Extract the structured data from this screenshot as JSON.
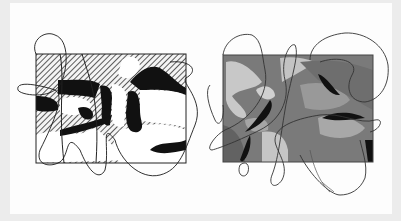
{
  "image": {
    "description": "Two abstract line drawings on white paper: a hatched black-and-white composition and a grayscale shaded composition, each overlaid with a continuous looping line",
    "background_color": "#ececec",
    "paper_color": "#fdfdfd"
  },
  "artworks": [
    {
      "name": "left-drawing",
      "style": "black ink with diagonal hatching",
      "colors": {
        "ink": "#111111",
        "paper": "#ffffff",
        "hatch": "#555555"
      }
    },
    {
      "name": "right-drawing",
      "style": "grayscale tonal shading",
      "colors": {
        "dark": "#6b6b6b",
        "mid": "#8e8e8e",
        "light": "#c9c9c9",
        "black": "#111111"
      }
    }
  ]
}
